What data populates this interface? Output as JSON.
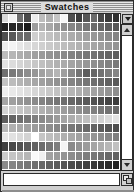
{
  "window": {
    "title": "Swatches",
    "close_box_icon": "close-box-icon",
    "palette_menu_icon": "chevron-down-icon",
    "resize_grip_icon": "resize-grip-icon"
  },
  "scrollbar": {
    "up_arrow_icon": "scroll-up-arrow-icon",
    "down_arrow_icon": "scroll-down-arrow-icon",
    "orientation": "vertical"
  },
  "info_field": {
    "value": "",
    "placeholder": ""
  },
  "swatch_grid": {
    "columns": 16,
    "rows": 17,
    "colors": [
      "#d8d8d8",
      "#f2f2f2",
      "#6e6e6e",
      "#4a4a4a",
      "#ececec",
      "#bdbdbd",
      "#b0b0b0",
      "#c5c5c5",
      "#f7f7f7",
      "#4f4f4f",
      "#3c3c3c",
      "#575757",
      "#6b6b6b",
      "#484848",
      "#3a3a3a",
      "#2f2f2f",
      "#1f1f1f",
      "#262626",
      "#2b2b2b",
      "#1a1a1a",
      "#9e9e9e",
      "#b4b4b4",
      "#a8a8a8",
      "#9a9a9a",
      "#8f8f8f",
      "#868686",
      "#7d7d7d",
      "#747474",
      "#6c6c6c",
      "#656565",
      "#5d5d5d",
      "#565656",
      "#4e4e4e",
      "#585858",
      "#6d6d6d",
      "#6a6a6a",
      "#cfcfcf",
      "#c8c8c8",
      "#c2c2c2",
      "#bababa",
      "#b3b3b3",
      "#acacac",
      "#a5a5a5",
      "#9e9e9e",
      "#979797",
      "#909090",
      "#8a8a8a",
      "#848484",
      "#ececec",
      "#f4f4f4",
      "#e6e6e6",
      "#dedede",
      "#d7d7d7",
      "#d0d0d0",
      "#cacaca",
      "#c4c4c4",
      "#bebebe",
      "#b8b8b8",
      "#b2b2b2",
      "#acacac",
      "#a6a6a6",
      "#a0a0a0",
      "#9a9a9a",
      "#949494",
      "#bdbdbd",
      "#b6b6b6",
      "#afafaf",
      "#a8a8a8",
      "#a1a1a1",
      "#9b9b9b",
      "#959595",
      "#8f8f8f",
      "#898989",
      "#838383",
      "#7d7d7d",
      "#777777",
      "#717171",
      "#6b6b6b",
      "#656565",
      "#5f5f5f",
      "#e2e2e2",
      "#dcdcdc",
      "#d5d5d5",
      "#cecece",
      "#c7c7c7",
      "#c0c0c0",
      "#b9b9b9",
      "#b2b2b2",
      "#ababab",
      "#a4a4a4",
      "#9d9d9d",
      "#969696",
      "#8f8f8f",
      "#888888",
      "#818181",
      "#7a7a7a",
      "#6f6f6f",
      "#797979",
      "#838383",
      "#8d8d8d",
      "#979797",
      "#a1a1a1",
      "#ababab",
      "#b5b5b5",
      "#9f9f9f",
      "#898989",
      "#737373",
      "#5d5d5d",
      "#676767",
      "#717171",
      "#7b7b7b",
      "#858585",
      "#c3c3c3",
      "#bcbcbc",
      "#b5b5b5",
      "#aeaeae",
      "#a7a7a7",
      "#a0a0a0",
      "#999999",
      "#929292",
      "#8b8b8b",
      "#848484",
      "#7d7d7d",
      "#767676",
      "#6f6f6f",
      "#686868",
      "#616161",
      "#5a5a5a",
      "#efefef",
      "#e9e9e9",
      "#e3e3e3",
      "#dddddd",
      "#d6d6d6",
      "#cfcfcf",
      "#c9c9c9",
      "#c2c2c2",
      "#bcbcbc",
      "#b5b5b5",
      "#afafaf",
      "#a8a8a8",
      "#a2a2a2",
      "#9b9b9b",
      "#959595",
      "#8e8e8e",
      "#a6a6a6",
      "#9f9f9f",
      "#989898",
      "#919191",
      "#8a8a8a",
      "#838383",
      "#7c7c7c",
      "#757575",
      "#6e6e6e",
      "#676767",
      "#606060",
      "#595959",
      "#525252",
      "#4b4b4b",
      "#444444",
      "#3d3d3d",
      "#d3d3d3",
      "#cdcdcd",
      "#c6c6c6",
      "#bfbfbf",
      "#b8b8b8",
      "#b1b1b1",
      "#aaaaaa",
      "#a3a3a3",
      "#9c9c9c",
      "#959595",
      "#8e8e8e",
      "#878787",
      "#808080",
      "#797979",
      "#727272",
      "#6b6b6b",
      "#5c5c5c",
      "#656565",
      "#6e6e6e",
      "#777777",
      "#808080",
      "#898989",
      "#929292",
      "#9b9b9b",
      "#a4a4a4",
      "#adadad",
      "#b6b6b6",
      "#bfbfbf",
      "#c8c8c8",
      "#d1d1d1",
      "#dadada",
      "#e3e3e3",
      "#b7b7b7",
      "#b0b0b0",
      "#a9a9a9",
      "#a2a2a2",
      "#9b9b9b",
      "#949494",
      "#8d8d8d",
      "#868686",
      "#7f7f7f",
      "#787878",
      "#717171",
      "#6a6a6a",
      "#636363",
      "#5c5c5c",
      "#555555",
      "#4e4e4e",
      "#e8e8e8",
      "#e1e1e1",
      "#dadada",
      "#d3d3d3",
      "#ccccccc",
      "#c5c5c5",
      "#bebebe",
      "#b7b7b7",
      "#b0b0b0",
      "#a9a9a9",
      "#a2a2a2",
      "#9b9b9b",
      "#949494",
      "#8d8d8d",
      "#868686",
      "#7f7f7f",
      "#3f3f3f",
      "#484848",
      "#515151",
      "#5a5a5a",
      "#636363",
      "#6c6c6c",
      "#757575",
      "#7e7e7e",
      "#f5f5f5",
      "#8a8a8a",
      "#939393",
      "#9c9c9c",
      "#a5a5a5",
      "#aeaeae",
      "#b7b7b7",
      "#c0c0c0",
      "#cbcbcb",
      "#c4c4c4",
      "#bdbdbd",
      "#b6b6b6",
      "#fafafa",
      "#f0f0f0",
      "#a1a1a1",
      "#9a9a9a",
      "#939393",
      "#8c8c8c",
      "#858585",
      "#7e7e7e",
      "#777777",
      "#707070",
      "#696969",
      "#626262",
      "#8b8b8b",
      "#848484",
      "#7d7d7d",
      "#767676",
      "#6f6f6f",
      "#686868",
      "#616161",
      "#5a5a5a",
      "#535353",
      "#4c4c4c",
      "#454545",
      "#3e3e3e",
      "#373737",
      "#303030",
      "#292929",
      "#222222"
    ]
  }
}
